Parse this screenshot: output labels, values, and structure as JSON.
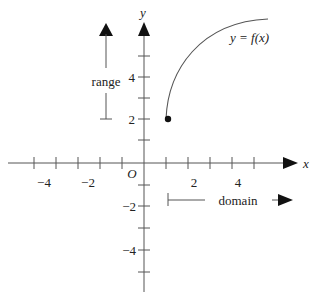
{
  "diagram": {
    "axes": {
      "x_label": "x",
      "y_label": "y",
      "origin_label": "O",
      "x_ticks": [
        {
          "value": -4,
          "label": "−4"
        },
        {
          "value": -2,
          "label": "−2"
        },
        {
          "value": 2,
          "label": "2"
        },
        {
          "value": 4,
          "label": "4"
        }
      ],
      "y_ticks": [
        {
          "value": 4,
          "label": "4"
        },
        {
          "value": 2,
          "label": "2"
        },
        {
          "value": -2,
          "label": "−2"
        },
        {
          "value": -4,
          "label": "−4"
        }
      ],
      "x_range": [
        -6,
        6
      ],
      "y_range": [
        -6,
        6
      ]
    },
    "curve": {
      "label": "y = f(x)",
      "start_point": {
        "x": 1,
        "y": 2,
        "filled": true
      },
      "end_point": {
        "x": 5.7,
        "y": 6.8
      }
    },
    "annotations": {
      "range_label": "range",
      "domain_label": "domain"
    },
    "colors": {
      "stroke": "#555555",
      "arrow": "#111111",
      "text": "#222222"
    }
  }
}
